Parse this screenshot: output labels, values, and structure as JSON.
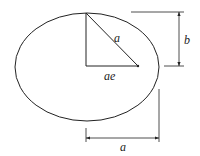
{
  "diagram": {
    "colors": {
      "stroke": "#222222",
      "background": "#ffffff"
    },
    "ellipse": {
      "cx": 87,
      "cy": 67,
      "rx": 72,
      "ry": 54
    },
    "labels": {
      "hypotenuse": "a",
      "focal_distance": "ae",
      "semi_minor": "b",
      "semi_major": "a"
    }
  }
}
